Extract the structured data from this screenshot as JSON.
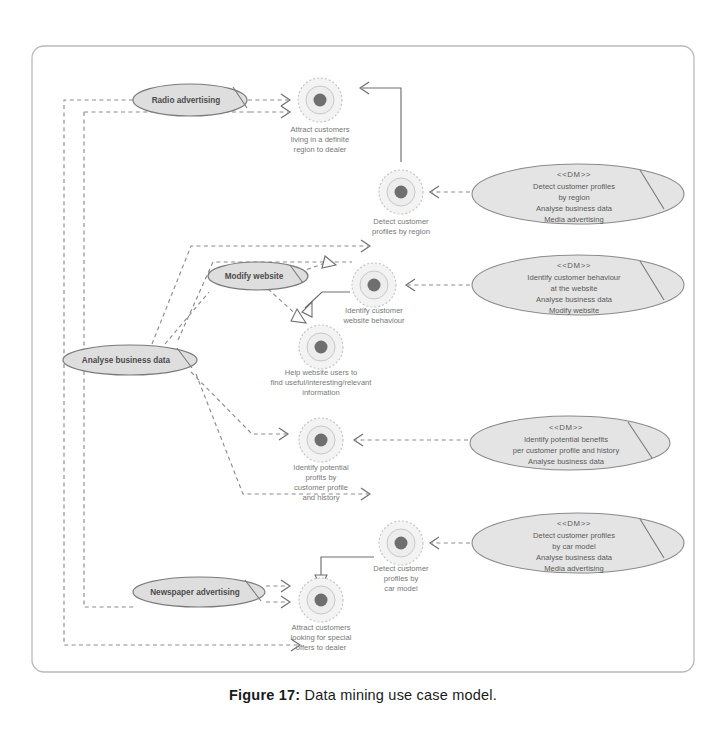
{
  "figure": {
    "caption_label": "Figure 17:",
    "caption_text": "Data mining use case model."
  },
  "actors": [
    {
      "id": "radio-advertising",
      "label": "Radio advertising",
      "cx": 190,
      "cy": 100,
      "rx": 57,
      "ry": 16
    },
    {
      "id": "modify-website",
      "label": "Modify website",
      "cx": 258,
      "cy": 276,
      "rx": 50,
      "ry": 14
    },
    {
      "id": "analyse-business-data",
      "label": "Analyse business data",
      "cx": 130,
      "cy": 360,
      "rx": 67,
      "ry": 15
    },
    {
      "id": "newspaper-advertising",
      "label": "Newspaper advertising",
      "cx": 199,
      "cy": 592,
      "rx": 66,
      "ry": 15
    }
  ],
  "use_cases": [
    {
      "id": "attract-customers-region",
      "cx": 320,
      "cy": 100,
      "lines": [
        "Attract customers",
        "living in a definite",
        "region to dealer"
      ],
      "label_y": 132
    },
    {
      "id": "detect-profiles-region",
      "cx": 401,
      "cy": 192,
      "lines": [
        "Detect customer",
        "profiles by region"
      ],
      "label_y": 224
    },
    {
      "id": "identify-customer-website-behaviour",
      "cx": 374,
      "cy": 285,
      "lines": [
        "Identify customer",
        "website behaviour"
      ],
      "label_y": 313
    },
    {
      "id": "help-website-users",
      "cx": 321,
      "cy": 347,
      "lines": [
        "Help website users to",
        "find useful/interesting/relevant",
        "information"
      ],
      "label_y": 375
    },
    {
      "id": "identify-potential-profits",
      "cx": 321,
      "cy": 440,
      "lines": [
        "Identify potential",
        "profits by",
        "customer profile",
        "and history"
      ],
      "label_y": 470
    },
    {
      "id": "detect-profiles-car-model",
      "cx": 401,
      "cy": 543,
      "lines": [
        "Detect customer",
        "profiles by",
        "car model"
      ],
      "label_y": 571
    },
    {
      "id": "attract-customers-offers",
      "cx": 321,
      "cy": 600,
      "lines": [
        "Attract customers",
        "looking for special",
        "offers to dealer"
      ],
      "label_y": 630
    }
  ],
  "dm_packages": [
    {
      "id": "dm-detect-profiles-region",
      "cx": 578,
      "cy": 194,
      "rx": 106,
      "ry": 30,
      "stereotype": "<<DM>>",
      "lines": [
        "Detect customer profiles",
        "by region",
        "Analyse business data",
        "Media advertising"
      ]
    },
    {
      "id": "dm-identify-customer-behaviour",
      "cx": 578,
      "cy": 285,
      "rx": 106,
      "ry": 30,
      "stereotype": "<<DM>>",
      "lines": [
        "Identify customer behaviour",
        "at the website",
        "Analyse business data",
        "Modify website"
      ]
    },
    {
      "id": "dm-identify-potential-benefits",
      "cx": 570,
      "cy": 443,
      "rx": 100,
      "ry": 27,
      "stereotype": "<<DM>>",
      "lines": [
        "Identify potential benefits",
        "per customer profile and history",
        "Analyse business data"
      ]
    },
    {
      "id": "dm-detect-profiles-car-model",
      "cx": 578,
      "cy": 543,
      "rx": 106,
      "ry": 30,
      "stereotype": "<<DM>>",
      "lines": [
        "Detect customer profiles",
        "by car model",
        "Analyse business data",
        "Media advertising"
      ]
    }
  ],
  "colors": {
    "ellipse_fill": "#dedede",
    "ellipse_stroke": "#7a7a7a",
    "connector": "#8c8c8c",
    "frame": "#b9b9b9",
    "caption": "#1a1a1a"
  }
}
